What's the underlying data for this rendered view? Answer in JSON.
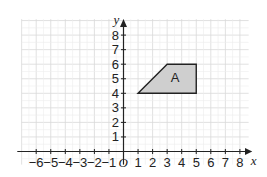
{
  "diagram": {
    "type": "coordinate-grid",
    "x_axis": {
      "label": "x",
      "tick_labels": [
        "−6",
        "−5",
        "−4",
        "−3",
        "−2",
        "−1",
        "1",
        "2",
        "3",
        "4",
        "5",
        "6",
        "7",
        "8"
      ],
      "min": -6,
      "max": 8
    },
    "y_axis": {
      "label": "y",
      "tick_labels": [
        "1",
        "2",
        "3",
        "4",
        "5",
        "6",
        "7",
        "8"
      ],
      "min": 1,
      "max": 8
    },
    "origin_label": "O",
    "shape": {
      "label": "A",
      "vertices": [
        [
          1,
          4
        ],
        [
          3,
          6
        ],
        [
          5,
          6
        ],
        [
          5,
          4
        ]
      ],
      "fill": "#cfcfcf",
      "stroke": "#222222"
    },
    "colors": {
      "grid": "#d9d9d9",
      "axis": "#222222"
    }
  }
}
